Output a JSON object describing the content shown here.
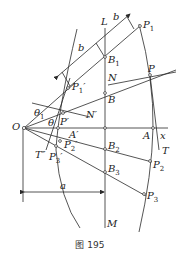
{
  "figure": {
    "caption": "图 195",
    "line_color": "#2a2a2a",
    "labels": {
      "O": "O",
      "L": "L",
      "M": "M",
      "x": "x",
      "P1": "P",
      "P1_sub": "1",
      "P1p": "P",
      "P1p_sub": "1",
      "P1p_prime": "′",
      "B1": "B",
      "B1_sub": "1",
      "N": "N",
      "P": "P",
      "B": "B",
      "Np": "N′",
      "Pp": "P′",
      "theta1": "θ",
      "theta1_sub": "1",
      "theta": "θ",
      "Ap": "A′",
      "A": "A",
      "T": "T",
      "Tpp": "T″",
      "P2p": "P",
      "P2p_sub": "2",
      "P2p_prime": "′",
      "P3p": "P",
      "P3p_sub": "3",
      "P3p_prime": "′",
      "B2": "B",
      "B2_sub": "2",
      "P2": "P",
      "P2_sub": "2",
      "B3": "B",
      "B3_sub": "3",
      "P3": "P",
      "P3_sub": "3",
      "b_top": "b",
      "b_mid": "b",
      "a": "a"
    }
  }
}
